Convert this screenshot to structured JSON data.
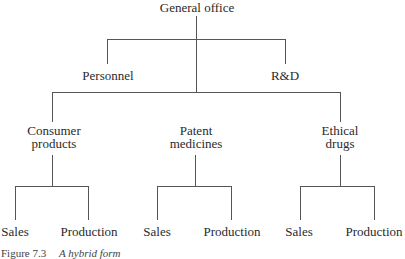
{
  "diagram": {
    "root": {
      "label": "General office"
    },
    "staff": [
      {
        "label": "Personnel"
      },
      {
        "label": "R&D"
      }
    ],
    "divisions": [
      {
        "line1": "Consumer",
        "line2": "products",
        "children": [
          {
            "label": "Sales"
          },
          {
            "label": "Production"
          }
        ]
      },
      {
        "line1": "Patent",
        "line2": "medicines",
        "children": [
          {
            "label": "Sales"
          },
          {
            "label": "Production"
          }
        ]
      },
      {
        "line1": "Ethical",
        "line2": "drugs",
        "children": [
          {
            "label": "Sales"
          },
          {
            "label": "Production"
          }
        ]
      }
    ]
  },
  "caption": {
    "figure": "Figure 7.3",
    "title": "A hybrid form"
  }
}
